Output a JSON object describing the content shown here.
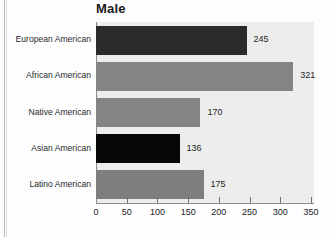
{
  "chart_data": {
    "type": "bar",
    "orientation": "horizontal",
    "title": "Male",
    "xlabel": "",
    "ylabel": "",
    "grid": false,
    "legend": null,
    "xlim": [
      0,
      350
    ],
    "xticks": [
      0,
      50,
      100,
      150,
      200,
      250,
      300,
      350
    ],
    "xtick_labels": [
      "0",
      "50",
      "100",
      "150",
      "200",
      "250",
      "300",
      "350"
    ],
    "categories": [
      "European American",
      "African American",
      "Native American",
      "Asian American",
      "Latino American"
    ],
    "values": [
      245,
      321,
      170,
      136,
      175
    ],
    "value_labels": [
      "245",
      "321",
      "170",
      "136",
      "175"
    ],
    "bar_colors": [
      "#2b2b2b",
      "#848484",
      "#848484",
      "#070707",
      "#7e7e7e"
    ],
    "plot_background": "#ededed",
    "axis_color": "#8d8d8d"
  },
  "page": {
    "background": "#fdfdfd"
  }
}
